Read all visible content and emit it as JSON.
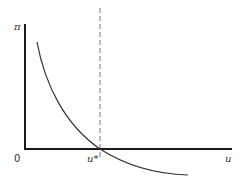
{
  "diagram": {
    "y_axis_label": "π",
    "x_axis_label": "u",
    "origin_label": "0",
    "marker_label": "u*",
    "elements": {
      "curve": "downward-sloping convex curve crossing the horizontal axis at u*",
      "dashed_line": "vertical dashed line at u*"
    }
  }
}
